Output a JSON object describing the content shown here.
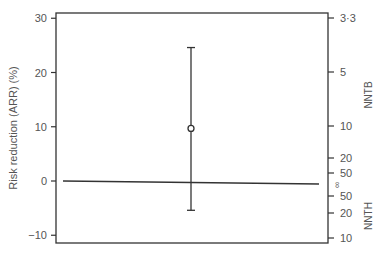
{
  "chart_data": {
    "type": "scatter",
    "title": "",
    "xlabel": "",
    "ylabel": "Risk reduction (ARR) (%)",
    "ylim": [
      -11.5,
      31
    ],
    "yticks": [
      30,
      20,
      10,
      0,
      -10
    ],
    "ytick_labels": [
      "30",
      "20",
      "10",
      "0",
      "−10"
    ],
    "secondary_axis": {
      "label_upper": "NNTB",
      "label_lower": "NNTH",
      "ticks": [
        {
          "label": "3·3",
          "arr": 30
        },
        {
          "label": "5",
          "arr": 20
        },
        {
          "label": "10",
          "arr": 10
        },
        {
          "label": "20",
          "arr": 5
        },
        {
          "label": "50",
          "arr": 2
        },
        {
          "label": "∞",
          "arr": 0
        },
        {
          "label": "50",
          "arr": -2
        },
        {
          "label": "20",
          "arr": -5
        },
        {
          "label": "10",
          "arr": -10
        }
      ]
    },
    "reference_line": {
      "y": 0,
      "label": "no effect"
    },
    "points": [
      {
        "x": 0.5,
        "y": 9.7,
        "ci_low": -5.4,
        "ci_high": 24.6
      }
    ],
    "grid": false,
    "legend": "none",
    "colors": {
      "axis": "#333333",
      "text": "#555555",
      "marker": "#333333"
    }
  }
}
